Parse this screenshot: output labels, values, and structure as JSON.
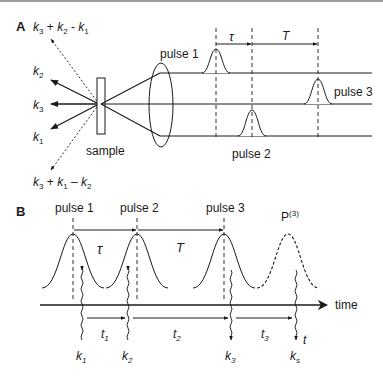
{
  "panelA": {
    "label": "A",
    "beams": [
      {
        "k": "k",
        "sub": "3",
        "expr_full": "k3 + k2 - k1",
        "parts": [
          [
            "k",
            "3"
          ],
          [
            " + ",
            ""
          ],
          [
            "k",
            "2"
          ],
          [
            " - ",
            ""
          ],
          [
            "k",
            "1"
          ]
        ]
      },
      {
        "k": "k",
        "sub": "2"
      },
      {
        "k": "k",
        "sub": "3"
      },
      {
        "k": "k",
        "sub": "1"
      },
      {
        "expr_full": "k3 + k1 - k2"
      }
    ],
    "top_signal": "k3 + k2 - k1",
    "bottom_signal": "k3 + k1 − k2",
    "sample_label": "sample",
    "pulse1_label": "pulse 1",
    "pulse2_label": "pulse 2",
    "pulse3_label": "pulse 3",
    "tau_label": "τ",
    "T_label": "T",
    "k2_label": "k",
    "k2_sub": "2",
    "k3_label": "k",
    "k3_sub": "3",
    "k1_label": "k",
    "k1_sub": "1"
  },
  "panelB": {
    "label": "B",
    "pulse1_label": "pulse 1",
    "pulse2_label": "pulse 2",
    "pulse3_label": "pulse 3",
    "polarization_label": "P",
    "polarization_sup": "(3)",
    "tau_label": "τ",
    "T_label": "T",
    "time_label": "time",
    "t1": "t",
    "t1_sub": "1",
    "t2": "t",
    "t2_sub": "2",
    "t3": "t",
    "t3_sub": "3",
    "t_label": "t",
    "k1": "k",
    "k1_sub": "1",
    "k2": "k",
    "k2_sub": "2",
    "k3": "k",
    "k3_sub": "3",
    "ks": "k",
    "ks_sub": "s"
  },
  "colors": {
    "line": "#1a1a1a",
    "background": "#ffffff"
  }
}
